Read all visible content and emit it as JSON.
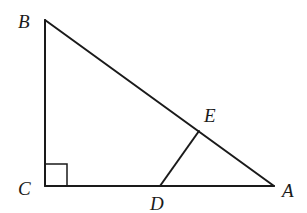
{
  "diagram": {
    "type": "geometry-triangle",
    "points": {
      "B": {
        "label": "B",
        "x": 45,
        "y": 20
      },
      "C": {
        "label": "C",
        "x": 45,
        "y": 186
      },
      "A": {
        "label": "A",
        "x": 274,
        "y": 186
      },
      "D": {
        "label": "D",
        "x": 160,
        "y": 186
      },
      "E": {
        "label": "E",
        "x": 199,
        "y": 131
      }
    },
    "segments": [
      "BC",
      "CA",
      "AB",
      "DE"
    ],
    "right_angle_at": "C",
    "colors": {
      "stroke": "#1a1a1a",
      "background": "#ffffff"
    }
  },
  "labels": {
    "B": "B",
    "C": "C",
    "A": "A",
    "D": "D",
    "E": "E"
  }
}
